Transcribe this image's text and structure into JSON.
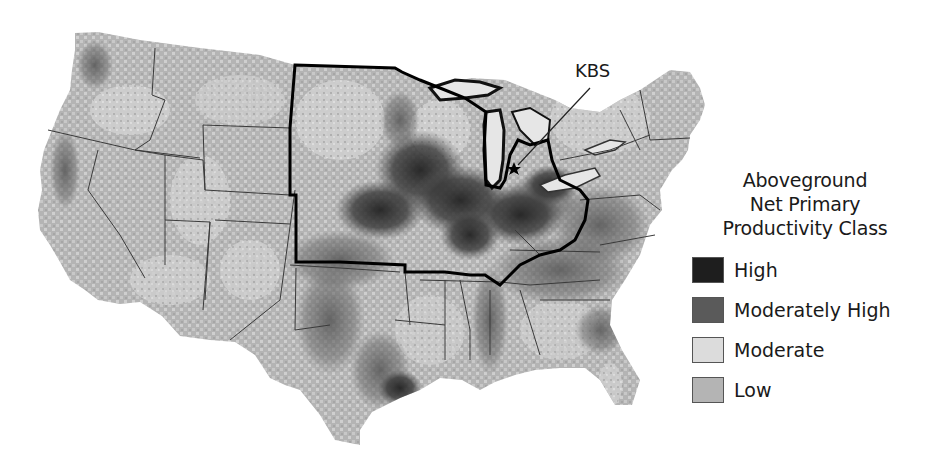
{
  "map": {
    "subject": "Contiguous United States",
    "highlighted_region_outline": "North Central / Midwest states (thick black border)",
    "site_marker": {
      "label": "KBS",
      "marker": "star",
      "location_desc": "southwest Michigan"
    }
  },
  "legend": {
    "title_lines": [
      "Aboveground",
      "Net Primary",
      "Productivity Class"
    ],
    "items": [
      {
        "label": "High",
        "color": "#1e1e1e"
      },
      {
        "label": "Moderately High",
        "color": "#5a5a5a"
      },
      {
        "label": "Moderate",
        "color": "#dcdcdc"
      },
      {
        "label": "Low",
        "color": "#b4b4b4"
      }
    ]
  },
  "colors": {
    "state_border": "#3a3a3a",
    "region_border": "#000000",
    "lakes": "#e6e6e6",
    "background": "#ffffff"
  }
}
